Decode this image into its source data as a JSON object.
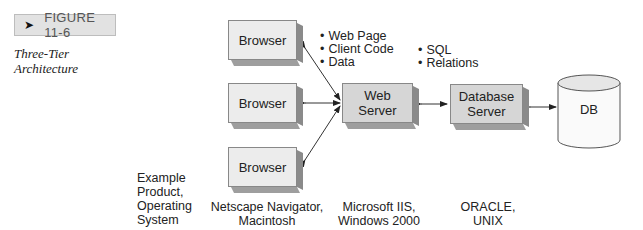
{
  "figure": {
    "badge_arrow": "➤",
    "badge_label": "FIGURE 11-6",
    "caption_lines": [
      "Three-Tier",
      "Architecture"
    ]
  },
  "diagram": {
    "nodes": {
      "browser_1": "Browser",
      "browser_2": "Browser",
      "browser_3": "Browser",
      "web_server": [
        "Web",
        "Server"
      ],
      "database_server": [
        "Database",
        "Server"
      ],
      "db": "DB"
    },
    "annotations": {
      "browser_to_web": [
        "Web Page",
        "Client Code",
        "Data"
      ],
      "web_to_database": [
        "SQL",
        "Relations"
      ]
    },
    "tier_labels": {
      "row_header": [
        "Example",
        "Product,",
        "Operating",
        "System"
      ],
      "client": [
        "Netscape Navigator,",
        "Macintosh"
      ],
      "web": [
        "Microsoft IIS,",
        "Windows 2000"
      ],
      "database": [
        "ORACLE,",
        "UNIX"
      ]
    },
    "colors": {
      "box_face": "#ececec",
      "box_face_dark": "#d6d6d6",
      "box_side": "#8a8a8a",
      "badge_bg": "#e2e2e2",
      "line": "#333333"
    }
  }
}
